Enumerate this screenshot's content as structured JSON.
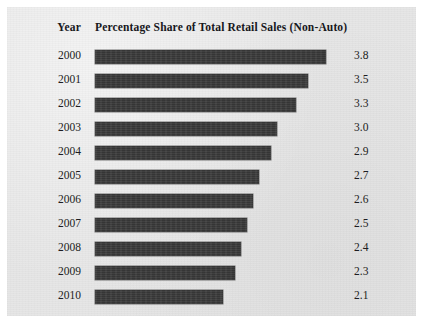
{
  "panel": {
    "background_color": "#e6e6e6",
    "bar_color": "#3a3a3a",
    "text_color": "#1d1d22"
  },
  "columns": {
    "year_header": "Year",
    "series_header": "Percentage Share of Total Retail Sales (Non-Auto)"
  },
  "chart_data": {
    "type": "bar",
    "orientation": "horizontal",
    "title": "Percentage Share of Total Retail Sales (Non-Auto)",
    "xlabel": "",
    "ylabel": "Year",
    "grid": false,
    "legend": "none",
    "xlim": [
      0,
      3.8
    ],
    "categories": [
      "2000",
      "2001",
      "2002",
      "2003",
      "2004",
      "2005",
      "2006",
      "2007",
      "2008",
      "2009",
      "2010"
    ],
    "values": [
      3.8,
      3.5,
      3.3,
      3.0,
      2.9,
      2.7,
      2.6,
      2.5,
      2.4,
      2.3,
      2.1
    ],
    "value_labels": [
      "3.8",
      "3.5",
      "3.3",
      "3.0",
      "2.9",
      "2.7",
      "2.6",
      "2.5",
      "2.4",
      "2.3",
      "2.1"
    ],
    "rows": [
      {
        "year": "2000",
        "value": 3.8,
        "label": "3.8"
      },
      {
        "year": "2001",
        "value": 3.5,
        "label": "3.5"
      },
      {
        "year": "2002",
        "value": 3.3,
        "label": "3.3"
      },
      {
        "year": "2003",
        "value": 3.0,
        "label": "3.0"
      },
      {
        "year": "2004",
        "value": 2.9,
        "label": "2.9"
      },
      {
        "year": "2005",
        "value": 2.7,
        "label": "2.7"
      },
      {
        "year": "2006",
        "value": 2.6,
        "label": "2.6"
      },
      {
        "year": "2007",
        "value": 2.5,
        "label": "2.5"
      },
      {
        "year": "2008",
        "value": 2.4,
        "label": "2.4"
      },
      {
        "year": "2009",
        "value": 2.3,
        "label": "2.3"
      },
      {
        "year": "2010",
        "value": 2.1,
        "label": "2.1"
      }
    ]
  },
  "layout": {
    "row_top_start": 38,
    "row_pitch": 24,
    "px_per_unit": 60.8
  }
}
